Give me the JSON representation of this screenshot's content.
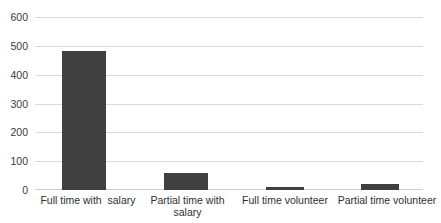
{
  "chart_data": {
    "type": "bar",
    "title": "",
    "title_clipped": true,
    "xlabel": "",
    "ylabel": "",
    "categories": [
      "Full time with  salary",
      "Partial time with salary",
      "Full time volunteer",
      "Partial time volunteer"
    ],
    "values": [
      483,
      60,
      10,
      20
    ],
    "ylim": [
      0,
      600
    ],
    "yticks": [
      0,
      100,
      200,
      300,
      400,
      500,
      600
    ],
    "ytick_labels": [
      "0",
      "100",
      "200",
      "300",
      "400",
      "500",
      "600"
    ],
    "grid": true,
    "grid_axis": "y",
    "legend": false,
    "legend_position": "none",
    "series": [
      {
        "name": "",
        "values": [
          483,
          60,
          10,
          20
        ]
      }
    ]
  },
  "style": {
    "bar_color": "#404040",
    "gridline_color": "#d9d9d9",
    "axis_color": "#cdcdcd",
    "text_color": "#2f2f2f",
    "background": "#ffffff"
  }
}
